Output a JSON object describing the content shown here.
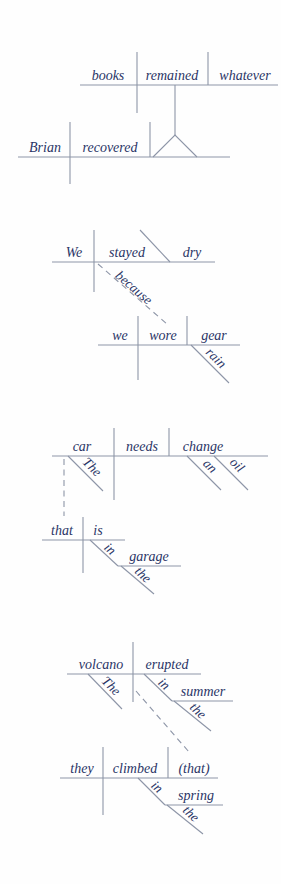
{
  "page": {
    "background": "#fefefe"
  },
  "colors": {
    "text": "#2a3566",
    "line": "#8d95a7"
  },
  "diagrams": [
    {
      "id": "noun-clause-pedestal",
      "top_clause": {
        "subject": "books",
        "verb": "remained",
        "complement": "whatever"
      },
      "base_clause": {
        "subject": "Brian",
        "verb": "recovered"
      }
    },
    {
      "id": "adverb-clause",
      "main_clause": {
        "subject": "We",
        "verb": "stayed",
        "complement": "dry"
      },
      "connector": "because",
      "subordinate_clause": {
        "subject": "we",
        "verb": "wore",
        "object": "gear",
        "object_modifier": "rain"
      }
    },
    {
      "id": "relative-clause",
      "main_clause": {
        "subject": "car",
        "subject_modifier": "The",
        "verb": "needs",
        "object": "change",
        "object_modifier_1": "an",
        "object_modifier_2": "oil"
      },
      "relative_clause": {
        "subject": "that",
        "verb": "is",
        "preposition": "in",
        "prep_object": "garage",
        "prep_object_modifier": "the"
      }
    },
    {
      "id": "elliptical-clause",
      "main_clause": {
        "subject": "volcano",
        "subject_modifier": "The",
        "verb": "erupted",
        "preposition": "in",
        "prep_object": "summer",
        "prep_object_modifier": "the"
      },
      "subordinate_clause": {
        "subject": "they",
        "verb": "climbed",
        "object": "(that)",
        "preposition": "in",
        "prep_object": "spring",
        "prep_object_modifier": "the"
      }
    }
  ]
}
